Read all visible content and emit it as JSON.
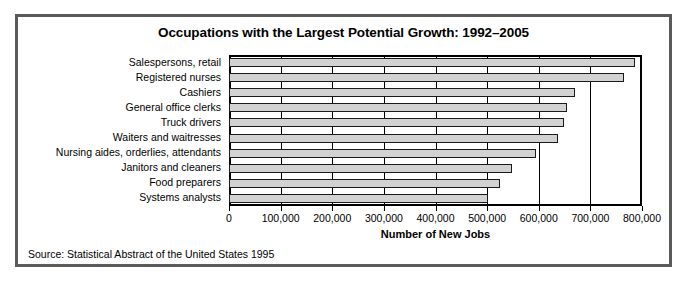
{
  "figure": {
    "title": "Occupations with the Largest Potential Growth: 1992–2005",
    "source_note": "Source: Statistical Abstract of the United States 1995",
    "frame_color": "#5a5a5a",
    "bar_fill_color": "#d2d2d2",
    "bar_edge_color": "#1a1a1a"
  },
  "chart_data": {
    "type": "bar",
    "orientation": "horizontal",
    "title": "Occupations with the Largest Potential Growth: 1992–2005",
    "xlabel": "Number of New Jobs",
    "ylabel": "",
    "xlim": [
      0,
      800000
    ],
    "grid": true,
    "legend": "none",
    "categories": [
      "Salespersons, retail",
      "Registered nurses",
      "Cashiers",
      "General office clerks",
      "Truck drivers",
      "Waiters and waitresses",
      "Nursing aides, orderlies, attendants",
      "Janitors and cleaners",
      "Food preparers",
      "Systems analysts"
    ],
    "values": [
      786000,
      765000,
      670000,
      654000,
      648000,
      637000,
      594000,
      548000,
      524000,
      501000
    ],
    "xticks": [
      0,
      100000,
      200000,
      300000,
      400000,
      500000,
      600000,
      700000,
      800000
    ],
    "xtick_labels": [
      "0",
      "100,000",
      "200,000",
      "300,000",
      "400,000",
      "500,000",
      "600,000",
      "700,000",
      "800,000"
    ]
  }
}
